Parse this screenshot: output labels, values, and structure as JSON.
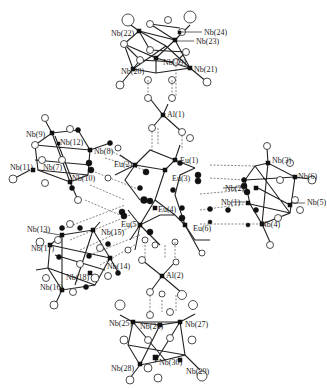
{
  "figure": {
    "type": "crystal-structure-ball-and-stick"
  },
  "labels": {
    "al": [
      {
        "id": "Al(1)",
        "x": 167,
        "y": 117
      },
      {
        "id": "Al(2)",
        "x": 166,
        "y": 278
      }
    ],
    "eu": [
      {
        "id": "Eu(1)",
        "x": 180,
        "y": 163
      },
      {
        "id": "Eu(2)",
        "x": 114,
        "y": 167
      },
      {
        "id": "Eu(3)",
        "x": 172,
        "y": 181
      },
      {
        "id": "Eu(4)",
        "x": 158,
        "y": 212
      },
      {
        "id": "Eu(5)",
        "x": 121,
        "y": 227
      },
      {
        "id": "Eu(6)",
        "x": 193,
        "y": 231
      }
    ],
    "nb": [
      {
        "id": "Nb(1)",
        "x": 221,
        "y": 205
      },
      {
        "id": "Nb(2)",
        "x": 225,
        "y": 191
      },
      {
        "id": "Nb(3)",
        "x": 272,
        "y": 163
      },
      {
        "id": "Nb(4)",
        "x": 261,
        "y": 227
      },
      {
        "id": "Nb(5)",
        "x": 307,
        "y": 205
      },
      {
        "id": "Nb(6)",
        "x": 298,
        "y": 179
      },
      {
        "id": "Nb(7)",
        "x": 43,
        "y": 170
      },
      {
        "id": "Nb(8)",
        "x": 94,
        "y": 154
      },
      {
        "id": "Nb(9)",
        "x": 26,
        "y": 137
      },
      {
        "id": "Nb(10)",
        "x": 72,
        "y": 181
      },
      {
        "id": "Nb(11)",
        "x": 10,
        "y": 170
      },
      {
        "id": "Nb(12)",
        "x": 60,
        "y": 145
      },
      {
        "id": "Nb(13)",
        "x": 27,
        "y": 232
      },
      {
        "id": "Nb(14)",
        "x": 107,
        "y": 269
      },
      {
        "id": "Nb(15)",
        "x": 101,
        "y": 235
      },
      {
        "id": "Nb(16)",
        "x": 40,
        "y": 290
      },
      {
        "id": "Nb(17)",
        "x": 31,
        "y": 251
      },
      {
        "id": "Nb(18)",
        "x": 66,
        "y": 280
      },
      {
        "id": "Nb(19)",
        "x": 163,
        "y": 65
      },
      {
        "id": "Nb(20)",
        "x": 121,
        "y": 74
      },
      {
        "id": "Nb(21)",
        "x": 194,
        "y": 72
      },
      {
        "id": "Nb(22)",
        "x": 111,
        "y": 36
      },
      {
        "id": "Nb(23)",
        "x": 196,
        "y": 44
      },
      {
        "id": "Nb(24)",
        "x": 204,
        "y": 35
      },
      {
        "id": "Nb(25)",
        "x": 109,
        "y": 326
      },
      {
        "id": "Nb(26)",
        "x": 140,
        "y": 329
      },
      {
        "id": "Nb(27)",
        "x": 185,
        "y": 327
      },
      {
        "id": "Nb(28)",
        "x": 111,
        "y": 371
      },
      {
        "id": "Nb(29)",
        "x": 186,
        "y": 374
      },
      {
        "id": "Nb(30)",
        "x": 159,
        "y": 365
      }
    ]
  },
  "colors": {
    "background": "#ffffff",
    "bond": "#222222",
    "metal_atom": "#111111",
    "oxygen_atom": "#ffffff"
  }
}
